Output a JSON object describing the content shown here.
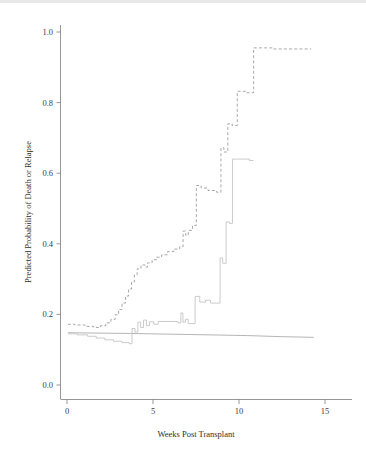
{
  "figure": {
    "background_color": "#ffffff",
    "axis_color": "#7c7c7c",
    "text_color": "#3d3d3d"
  },
  "chart_data": {
    "type": "line",
    "title": "",
    "subtitle": "",
    "xlabel": "Weeks Post Transplant",
    "ylabel": "Predicted Probability of Death or Relapse",
    "xlim": [
      -0.7,
      16.5
    ],
    "ylim": [
      0.0,
      1.05
    ],
    "xticks": [
      0,
      5,
      10,
      15
    ],
    "xtick_labels": [
      "0",
      "5",
      "10",
      "15"
    ],
    "yticks": [
      0.0,
      0.2,
      0.4,
      0.6,
      0.8,
      1.0
    ],
    "ytick_labels": [
      "0.0",
      "0.2",
      "0.4",
      "0.6",
      "0.8",
      "1.0"
    ],
    "grid": false,
    "legend": null,
    "annotations": [],
    "series": [
      {
        "name": "upper-confidence-band",
        "style": "dashed",
        "color": "#9a9a9a",
        "dash": "3,2.2",
        "width": 0.85,
        "points": [
          [
            0.05,
            0.172
          ],
          [
            0.45,
            0.172
          ],
          [
            0.45,
            0.17
          ],
          [
            1.05,
            0.17
          ],
          [
            1.05,
            0.166
          ],
          [
            1.55,
            0.166
          ],
          [
            1.55,
            0.163
          ],
          [
            1.95,
            0.163
          ],
          [
            1.95,
            0.168
          ],
          [
            2.25,
            0.168
          ],
          [
            2.25,
            0.176
          ],
          [
            2.55,
            0.176
          ],
          [
            2.55,
            0.186
          ],
          [
            2.8,
            0.186
          ],
          [
            2.8,
            0.199
          ],
          [
            3.0,
            0.199
          ],
          [
            3.0,
            0.214
          ],
          [
            3.2,
            0.214
          ],
          [
            3.2,
            0.232
          ],
          [
            3.4,
            0.232
          ],
          [
            3.4,
            0.252
          ],
          [
            3.58,
            0.252
          ],
          [
            3.58,
            0.272
          ],
          [
            3.75,
            0.272
          ],
          [
            3.75,
            0.292
          ],
          [
            3.92,
            0.292
          ],
          [
            3.92,
            0.312
          ],
          [
            4.08,
            0.312
          ],
          [
            4.08,
            0.329
          ],
          [
            4.3,
            0.329
          ],
          [
            4.3,
            0.34
          ],
          [
            4.55,
            0.34
          ],
          [
            4.55,
            0.334
          ],
          [
            4.68,
            0.334
          ],
          [
            4.68,
            0.346
          ],
          [
            4.95,
            0.346
          ],
          [
            4.95,
            0.355
          ],
          [
            5.2,
            0.355
          ],
          [
            5.2,
            0.362
          ],
          [
            5.5,
            0.362
          ],
          [
            5.5,
            0.369
          ],
          [
            5.85,
            0.369
          ],
          [
            5.85,
            0.378
          ],
          [
            6.2,
            0.378
          ],
          [
            6.2,
            0.385
          ],
          [
            6.55,
            0.385
          ],
          [
            6.55,
            0.392
          ],
          [
            6.75,
            0.392
          ],
          [
            6.75,
            0.436
          ],
          [
            6.9,
            0.436
          ],
          [
            6.9,
            0.424
          ],
          [
            7.05,
            0.424
          ],
          [
            7.05,
            0.438
          ],
          [
            7.3,
            0.438
          ],
          [
            7.3,
            0.452
          ],
          [
            7.52,
            0.452
          ],
          [
            7.52,
            0.565
          ],
          [
            7.8,
            0.565
          ],
          [
            7.8,
            0.558
          ],
          [
            8.2,
            0.558
          ],
          [
            8.2,
            0.551
          ],
          [
            8.7,
            0.551
          ],
          [
            8.7,
            0.546
          ],
          [
            8.95,
            0.546
          ],
          [
            8.95,
            0.672
          ],
          [
            9.12,
            0.672
          ],
          [
            9.12,
            0.66
          ],
          [
            9.35,
            0.66
          ],
          [
            9.35,
            0.74
          ],
          [
            9.6,
            0.74
          ],
          [
            9.6,
            0.735
          ],
          [
            9.9,
            0.735
          ],
          [
            9.9,
            0.832
          ],
          [
            10.4,
            0.832
          ],
          [
            10.4,
            0.828
          ],
          [
            10.85,
            0.828
          ],
          [
            10.85,
            0.955
          ],
          [
            12.0,
            0.955
          ],
          [
            12.0,
            0.952
          ],
          [
            14.2,
            0.952
          ]
        ]
      },
      {
        "name": "point-estimate-line",
        "style": "solid",
        "color": "#adadad",
        "dash": "none",
        "width": 0.9,
        "points": [
          [
            0.05,
            0.148
          ],
          [
            3.7,
            0.146
          ],
          [
            7.2,
            0.143
          ],
          [
            10.5,
            0.14
          ],
          [
            12.4,
            0.137
          ],
          [
            14.35,
            0.135
          ]
        ]
      },
      {
        "name": "lower-confidence-band",
        "style": "solid-step",
        "color": "#c2c2c2",
        "dash": "none",
        "width": 0.85,
        "points": [
          [
            0.05,
            0.145
          ],
          [
            0.6,
            0.145
          ],
          [
            0.6,
            0.142
          ],
          [
            1.2,
            0.142
          ],
          [
            1.2,
            0.138
          ],
          [
            1.7,
            0.138
          ],
          [
            1.7,
            0.133
          ],
          [
            2.2,
            0.133
          ],
          [
            2.2,
            0.128
          ],
          [
            2.7,
            0.128
          ],
          [
            2.7,
            0.124
          ],
          [
            3.2,
            0.124
          ],
          [
            3.2,
            0.12
          ],
          [
            3.62,
            0.12
          ],
          [
            3.62,
            0.117
          ],
          [
            3.78,
            0.117
          ],
          [
            3.78,
            0.16
          ],
          [
            3.95,
            0.16
          ],
          [
            3.95,
            0.15
          ],
          [
            4.12,
            0.15
          ],
          [
            4.12,
            0.178
          ],
          [
            4.28,
            0.178
          ],
          [
            4.28,
            0.163
          ],
          [
            4.45,
            0.163
          ],
          [
            4.45,
            0.184
          ],
          [
            4.62,
            0.184
          ],
          [
            4.62,
            0.168
          ],
          [
            4.8,
            0.168
          ],
          [
            4.8,
            0.179
          ],
          [
            5.05,
            0.179
          ],
          [
            5.05,
            0.172
          ],
          [
            5.3,
            0.172
          ],
          [
            5.3,
            0.18
          ],
          [
            6.45,
            0.18
          ],
          [
            6.45,
            0.176
          ],
          [
            6.62,
            0.176
          ],
          [
            6.62,
            0.204
          ],
          [
            6.74,
            0.204
          ],
          [
            6.74,
            0.178
          ],
          [
            6.88,
            0.178
          ],
          [
            6.88,
            0.186
          ],
          [
            7.05,
            0.186
          ],
          [
            7.05,
            0.174
          ],
          [
            7.45,
            0.174
          ],
          [
            7.45,
            0.251
          ],
          [
            7.72,
            0.251
          ],
          [
            7.72,
            0.235
          ],
          [
            8.05,
            0.235
          ],
          [
            8.05,
            0.24
          ],
          [
            8.35,
            0.24
          ],
          [
            8.35,
            0.232
          ],
          [
            8.9,
            0.232
          ],
          [
            8.9,
            0.36
          ],
          [
            9.05,
            0.36
          ],
          [
            9.05,
            0.345
          ],
          [
            9.25,
            0.345
          ],
          [
            9.25,
            0.462
          ],
          [
            9.45,
            0.462
          ],
          [
            9.45,
            0.458
          ],
          [
            9.62,
            0.458
          ],
          [
            9.62,
            0.64
          ],
          [
            10.6,
            0.64
          ],
          [
            10.6,
            0.636
          ],
          [
            10.85,
            0.636
          ]
        ]
      }
    ]
  },
  "axes": {
    "y_axis_label": "Predicted Probability of Death or Relapse",
    "x_axis_label": "Weeks Post Transplant",
    "y_tick_0": "0.0",
    "y_tick_1": "0.2",
    "y_tick_2": "0.4",
    "y_tick_3": "0.6",
    "y_tick_4": "0.8",
    "y_tick_5": "1.0",
    "x_tick_0": "0",
    "x_tick_1": "5",
    "x_tick_2": "10",
    "x_tick_3": "15"
  }
}
